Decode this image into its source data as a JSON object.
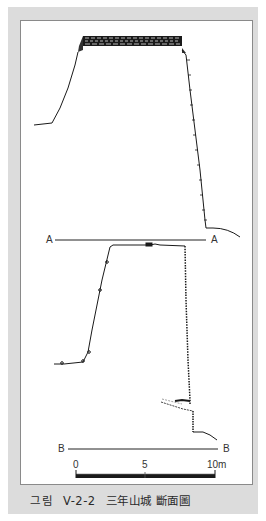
{
  "figure": {
    "caption": {
      "label": "그림",
      "number": "V-2-2",
      "title": "三年山城 斷面圖"
    },
    "sections": [
      {
        "id": "A",
        "left_label": "A",
        "right_label": "A"
      },
      {
        "id": "B",
        "left_label": "B",
        "right_label": "B"
      }
    ],
    "scale_bar": {
      "ticks": [
        "0",
        "5",
        "10m"
      ]
    }
  }
}
